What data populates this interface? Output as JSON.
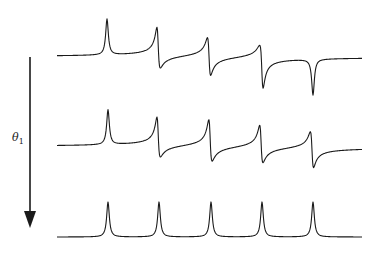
{
  "figure": {
    "arrow": {
      "label_symbol": "θ",
      "label_subscript": "1",
      "direction": "down"
    },
    "traces": [
      {
        "name": "top-trace",
        "baseline_y": 57,
        "peaks": [
          {
            "x": 107,
            "type": "absorptive",
            "amp": 36
          },
          {
            "x": 158,
            "type": "mixed",
            "amp": 34,
            "neg": 4
          },
          {
            "x": 209,
            "type": "dispersive",
            "amp": 20,
            "neg": 18
          },
          {
            "x": 262,
            "type": "mixed-neg",
            "amp": 4,
            "neg": 36
          },
          {
            "x": 313,
            "type": "negative",
            "amp": 0,
            "neg": 36
          }
        ]
      },
      {
        "name": "middle-trace",
        "baseline_y": 147,
        "peaks": [
          {
            "x": 108,
            "type": "absorptive",
            "amp": 35
          },
          {
            "x": 158,
            "type": "mixed",
            "amp": 34,
            "neg": 3
          },
          {
            "x": 210,
            "type": "mixed",
            "amp": 32,
            "neg": 8
          },
          {
            "x": 261,
            "type": "dispersive",
            "amp": 26,
            "neg": 11
          },
          {
            "x": 312,
            "type": "dispersive",
            "amp": 17,
            "neg": 19
          }
        ]
      },
      {
        "name": "bottom-trace",
        "baseline_y": 237,
        "peaks": [
          {
            "x": 108,
            "type": "absorptive",
            "amp": 35
          },
          {
            "x": 159,
            "type": "absorptive",
            "amp": 35
          },
          {
            "x": 211,
            "type": "absorptive",
            "amp": 35
          },
          {
            "x": 262,
            "type": "absorptive",
            "amp": 35
          },
          {
            "x": 313,
            "type": "absorptive",
            "amp": 35
          }
        ]
      }
    ],
    "x_start": 57,
    "x_end": 362
  }
}
